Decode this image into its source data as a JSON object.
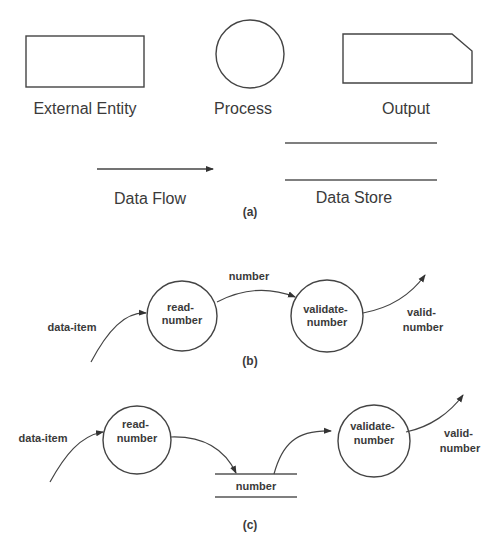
{
  "legend": {
    "external_entity": "External Entity",
    "process": "Process",
    "output": "Output",
    "data_flow": "Data Flow",
    "data_store": "Data Store",
    "caption": "(a)"
  },
  "diagram_b": {
    "caption": "(b)",
    "input_flow": "data-item",
    "process1": [
      "read-",
      "number"
    ],
    "flow_between": "number",
    "process2": [
      "validate-",
      "number"
    ],
    "output_flow": [
      "valid-",
      "number"
    ]
  },
  "diagram_c": {
    "caption": "(c)",
    "input_flow": "data-item",
    "process1": [
      "read-",
      "number"
    ],
    "store": "number",
    "process2": [
      "validate-",
      "number"
    ],
    "output_flow": [
      "valid-",
      "number"
    ]
  }
}
